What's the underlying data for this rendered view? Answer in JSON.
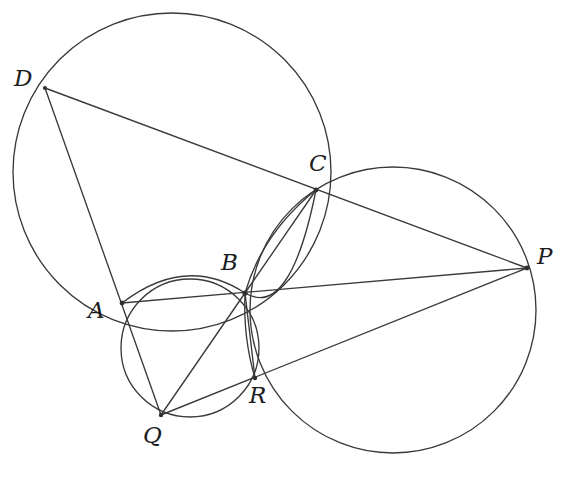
{
  "figure": {
    "background_color": "#ffffff",
    "stroke_color": "#3a3a3c",
    "label_color": "#1d1d1f",
    "width": 563,
    "height": 480
  },
  "labels": {
    "D": "D",
    "C": "C",
    "P": "P",
    "B": "B",
    "A": "A",
    "R": "R",
    "Q": "Q"
  },
  "points": [
    {
      "name": "D",
      "label": "D",
      "x": 45,
      "y": 88,
      "label_x": 14,
      "label_y": 67
    },
    {
      "name": "C",
      "label": "C",
      "x": 316,
      "y": 190,
      "label_x": 309,
      "label_y": 152
    },
    {
      "name": "P",
      "label": "P",
      "x": 527,
      "y": 268,
      "label_x": 537,
      "label_y": 245
    },
    {
      "name": "B",
      "label": "B",
      "x": 245,
      "y": 293,
      "label_x": 221,
      "label_y": 251
    },
    {
      "name": "A",
      "label": "A",
      "x": 122,
      "y": 303,
      "label_x": 88,
      "label_y": 299
    },
    {
      "name": "R",
      "label": "R",
      "x": 255,
      "y": 378,
      "label_x": 249,
      "label_y": 384
    },
    {
      "name": "Q",
      "label": "Q",
      "x": 161,
      "y": 415,
      "label_x": 143,
      "label_y": 424
    }
  ],
  "circles": [
    {
      "name": "circle-dac",
      "through": [
        "D",
        "A",
        "C"
      ],
      "cx": 172,
      "cy": 172,
      "r": 159
    },
    {
      "name": "circle-cpr",
      "through": [
        "C",
        "P",
        "R"
      ],
      "cx": 393,
      "cy": 310,
      "r": 143
    },
    {
      "name": "circle-abqr",
      "through": [
        "A",
        "B",
        "Q",
        "R"
      ],
      "cx": 190,
      "cy": 348,
      "r": 69
    }
  ],
  "arcs": [
    {
      "name": "arc-abc",
      "through": [
        "A",
        "B",
        "C"
      ],
      "description": "arc bulging upward from A through B toward C"
    },
    {
      "name": "arc-aqr",
      "through": [
        "A",
        "Q",
        "R"
      ],
      "description": "lower lens arc from B down to R"
    }
  ],
  "segments": [
    {
      "name": "segment-d-p",
      "from": "D",
      "to": "P",
      "via": [
        "C"
      ]
    },
    {
      "name": "segment-d-q",
      "from": "D",
      "to": "Q",
      "via": [
        "A"
      ]
    },
    {
      "name": "segment-a-p",
      "from": "A",
      "to": "P",
      "via": [
        "B"
      ]
    },
    {
      "name": "segment-b-c",
      "from": "B",
      "to": "C"
    },
    {
      "name": "segment-b-q",
      "from": "B",
      "to": "Q"
    },
    {
      "name": "segment-b-r",
      "from": "B",
      "to": "R"
    },
    {
      "name": "segment-q-p",
      "from": "Q",
      "to": "P",
      "via": [
        "R"
      ]
    },
    {
      "name": "segment-c-q-chord",
      "from": "C",
      "to": "B"
    }
  ]
}
